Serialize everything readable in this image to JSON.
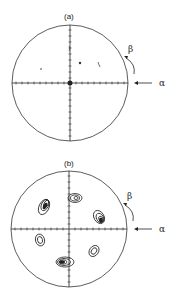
{
  "figures": [
    {
      "label": "(a)",
      "beta": "β",
      "alpha": "α",
      "cx": 70,
      "cy": 83,
      "r": 58
    },
    {
      "label": "(b)",
      "beta": "β",
      "alpha": "α",
      "cx": 69,
      "cy": 229,
      "r": 58
    }
  ],
  "colors": {
    "line": "#222222",
    "background": "#ffffff"
  }
}
